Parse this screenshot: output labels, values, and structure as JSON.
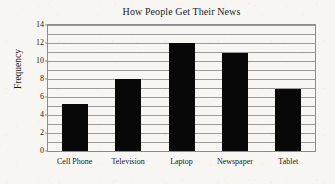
{
  "chart_data": {
    "type": "bar",
    "title": "How People Get Their News",
    "xlabel": "",
    "ylabel": "Frequency",
    "categories": [
      "Cell Phone",
      "Television",
      "Laptop",
      "Newspaper",
      "Tablet"
    ],
    "values": [
      5.2,
      8,
      12,
      10.9,
      6.9
    ],
    "ylim": [
      0,
      14
    ],
    "ytick_labels": [
      "0",
      "2",
      "4",
      "6",
      "8",
      "10",
      "12",
      "14"
    ],
    "ytick_values": [
      0,
      2,
      4,
      6,
      8,
      10,
      12,
      14
    ],
    "gridline_values": [
      1,
      2,
      3,
      4,
      5,
      6,
      7,
      8,
      9,
      10,
      11,
      12,
      13,
      14
    ],
    "grid": true,
    "legend": false,
    "legend_position": "none",
    "bar_color": "#080808",
    "grid_color": "#9a9a9a",
    "axis_color": "#8c8c8c",
    "background_color": "#f7f6f3"
  }
}
